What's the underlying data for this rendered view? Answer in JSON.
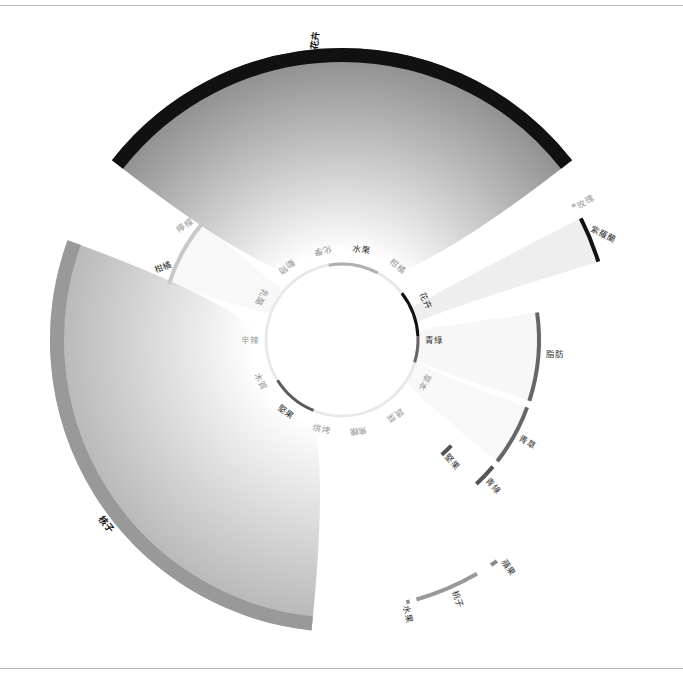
{
  "chart_data": {
    "type": "sunburst-chord",
    "title": "",
    "center": [
      342,
      340
    ],
    "inner_ring": {
      "radius": 76,
      "base_color": "#e8e8e8",
      "segments": [
        {
          "label": "水果",
          "angle": -78,
          "arc": [
            -100,
            -62
          ],
          "color": "#b0b0b0",
          "highlight": true
        },
        {
          "label": "柑橘",
          "angle": -53,
          "arc": null,
          "color": "#e8e8e8",
          "highlight": false
        },
        {
          "label": "花卉",
          "angle": -25,
          "arc": [
            -38,
            -3
          ],
          "color": "#111111",
          "highlight": true
        },
        {
          "label": "青綠",
          "angle": 0,
          "arc": [
            -3,
            17
          ],
          "color": "#666666",
          "highlight": true
        },
        {
          "label": "草本",
          "angle": 27,
          "arc": null,
          "color": "#e8e8e8",
          "highlight": false
        },
        {
          "label": "蔬菜",
          "angle": 55,
          "arc": null,
          "color": "#e8e8e8",
          "highlight": false
        },
        {
          "label": "焦糖",
          "angle": 80,
          "arc": null,
          "color": "#e8e8e8",
          "highlight": false
        },
        {
          "label": "烘烤",
          "angle": 103,
          "arc": null,
          "color": "#e8e8e8",
          "highlight": false
        },
        {
          "label": "堅果",
          "angle": 128,
          "arc": [
            112,
            148
          ],
          "color": "#5a5a5a",
          "highlight": true
        },
        {
          "label": "木質",
          "angle": 153,
          "arc": null,
          "color": "#e8e8e8",
          "highlight": false
        },
        {
          "label": "辛辣",
          "angle": 180,
          "arc": null,
          "color": "#e8e8e8",
          "highlight": false
        },
        {
          "label": "乳酪",
          "angle": -152,
          "arc": null,
          "color": "#e8e8e8",
          "highlight": false
        },
        {
          "label": "動物",
          "angle": -127,
          "arc": null,
          "color": "#e8e8e8",
          "highlight": false
        },
        {
          "label": "化學",
          "angle": -102,
          "arc": null,
          "color": "#e8e8e8",
          "highlight": false
        }
      ]
    },
    "outer_sectors": [
      {
        "label": "花卉",
        "arc_start": -142,
        "arc_end": -38,
        "radius": 292,
        "color": "#111111",
        "fill_from": "#888888",
        "fill_to": "#ffffff"
      },
      {
        "label": "核子",
        "arc_start": 96,
        "arc_end": 200,
        "radius": 292,
        "color": "#999999",
        "fill_from": "#aaaaaa",
        "fill_to": "#ffffff"
      }
    ],
    "sub_arcs": [
      {
        "label": "玫瑰",
        "group": "花卉",
        "arc": [
          -30.5,
          -29.8
        ],
        "radius": 268,
        "color": "#bbbbbb"
      },
      {
        "label": "紫羅蘭",
        "group": "花卉",
        "arc": [
          -27,
          -17
        ],
        "radius": 268,
        "color": "#111111"
      },
      {
        "label": "脂肪",
        "group": "青綠",
        "arc": [
          -8,
          18
        ],
        "radius": 197,
        "color": "#666666"
      },
      {
        "label": "青草",
        "group": "青綠",
        "arc": [
          20,
          38
        ],
        "radius": 197,
        "color": "#666666"
      },
      {
        "label": "青綠",
        "group": "青綠",
        "arc": [
          40,
          47
        ],
        "radius": 197,
        "color": "#555555"
      },
      {
        "label": "堅果",
        "group": "青綠",
        "arc": [
          44,
          49
        ],
        "radius": 152,
        "color": "#555555"
      },
      {
        "label": "柑橘",
        "group": "水果",
        "arc": [
          -162,
          -148
        ],
        "radius": 182,
        "color": "#c8c8c8"
      },
      {
        "label": "檸檬",
        "group": "水果",
        "arc": [
          -148,
          -140
        ],
        "radius": 182,
        "color": "#c8c8c8"
      },
      {
        "label": "蘋果",
        "group": "核子",
        "arc": [
          55,
          56.5
        ],
        "radius": 270,
        "color": "#888888"
      },
      {
        "label": "桃子",
        "group": "核子",
        "arc": [
          60,
          74
        ],
        "radius": 270,
        "color": "#999999"
      },
      {
        "label": "水果",
        "group": "核子",
        "arc": [
          75.5,
          76.2
        ],
        "radius": 270,
        "color": "#888888"
      }
    ],
    "legend": [],
    "xlabel": "",
    "ylabel": ""
  },
  "labels": {
    "outer_flower": "花卉",
    "outer_stone": "核子",
    "rose": "玫瑰",
    "violet": "紫羅蘭",
    "fat": "脂肪",
    "grass": "青草",
    "green": "青綠",
    "nut": "堅果",
    "citrus": "柑橘",
    "lemon": "檸檬",
    "apple": "蘋果",
    "peach": "桃子",
    "fruit": "水果"
  }
}
